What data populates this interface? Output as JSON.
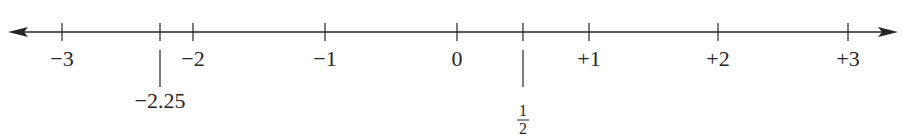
{
  "diagram": {
    "type": "number-line",
    "axis": {
      "y": 32,
      "x_start": 8,
      "x_end": 898,
      "color": "#262626"
    },
    "ticks": [
      {
        "value": -3,
        "label": "−3",
        "x": 62
      },
      {
        "value": -2,
        "label": "−2",
        "x": 193
      },
      {
        "value": -1,
        "label": "−1",
        "x": 325
      },
      {
        "value": 0,
        "label": "0",
        "x": 457
      },
      {
        "value": 1,
        "label": "+1",
        "x": 589
      },
      {
        "value": 2,
        "label": "+2",
        "x": 718
      },
      {
        "value": 3,
        "label": "+3",
        "x": 848
      }
    ],
    "markers": [
      {
        "value": -2.25,
        "label": "−2.25",
        "x": 160,
        "kind": "decimal"
      },
      {
        "value": 0.5,
        "label_numerator": "1",
        "label_denominator": "2",
        "x": 523,
        "kind": "fraction"
      }
    ]
  }
}
